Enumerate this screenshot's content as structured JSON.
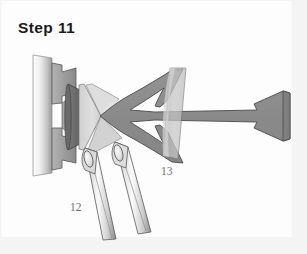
{
  "figure": {
    "title": "Step 11",
    "background_color": "#fdfdfd",
    "frame_color": "#f4f4f4",
    "border_color": "#e6e6e6",
    "title_color": "#1b1b1b",
    "label_color": "#6f6f6f",
    "callouts": [
      {
        "name": "callout-12",
        "text": "12",
        "x": 70,
        "y": 201,
        "points_to": "lower-spray-nozzle-tubes"
      },
      {
        "name": "callout-13",
        "text": "13",
        "x": 161,
        "y": 165,
        "points_to": "translucent-deflector-disc"
      }
    ],
    "palette": {
      "mid_gray": "#8e8e8e",
      "dark_gray": "#6e6e6e",
      "darker_gray": "#5f5f5f",
      "light_gray": "#c9c9c9",
      "pale_gray": "#e2e2e2",
      "outline": "#4f4f4f",
      "white": "#ffffff",
      "plate_light": "#fbfbfb",
      "plate_dark": "#9a9a9a"
    },
    "parts": [
      {
        "name": "mounting-plate",
        "label": "",
        "fill": "gradient-white-to-gray"
      },
      {
        "name": "stepped-bracket-flange",
        "label": "",
        "fill": "#9c9c9c"
      },
      {
        "name": "dark-inner-cone",
        "label": "",
        "fill": "#6e6e6e"
      },
      {
        "name": "light-bowtie-cone",
        "label": "",
        "fill": "#d5d5d5"
      },
      {
        "name": "main-horn-body",
        "label": "",
        "fill": "#8d8d8d"
      },
      {
        "name": "translucent-deflector-disc",
        "label": "13",
        "fill": "#c2c2c2"
      },
      {
        "name": "right-bell-flare",
        "label": "",
        "fill": "#8d8d8d"
      },
      {
        "name": "lower-spray-nozzle-tubes",
        "label": "12",
        "fill": "gradient-light"
      }
    ]
  }
}
